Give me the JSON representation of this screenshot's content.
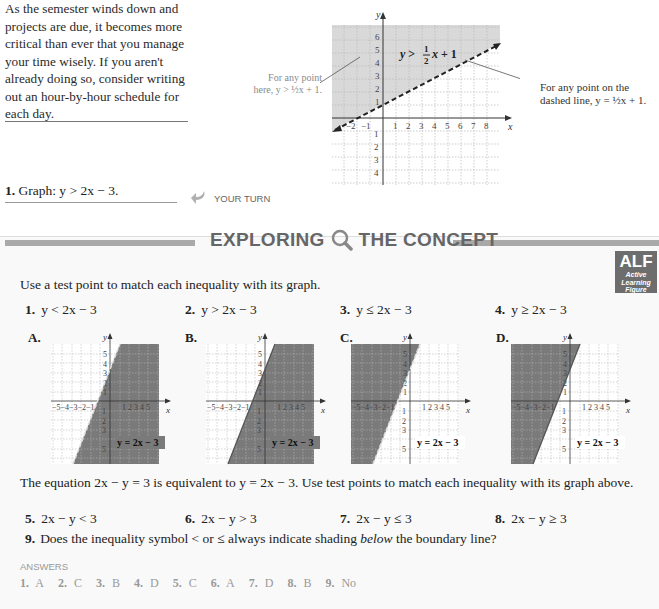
{
  "study_tip": {
    "text": "As the semester winds down and projects are due, it becomes more critical than ever that you manage your time wisely. If you aren't already doing so, consider writing out an hour-by-hour schedule for each day."
  },
  "example": {
    "number": "1.",
    "text": "Graph: y > 2x − 3.",
    "your_turn_label": "YOUR TURN",
    "your_turn_icon": "curved-arrow-icon"
  },
  "main_graph": {
    "inequality_label": "y > ½x + 1",
    "note_left_line1": "For any point",
    "note_left_line2": "here, y > ½x + 1.",
    "note_right_line1": "For any point on the",
    "note_right_line2": "dashed line, y = ½x + 1.",
    "x_axis_label": "x",
    "y_axis_label": "y"
  },
  "exploring": {
    "title_left": "EXPLORING",
    "title_right": "THE CONCEPT",
    "icon": "magnifier-icon",
    "alf": {
      "big": "ALF",
      "line1": "Active",
      "line2": "Learning",
      "line3": "Figure"
    },
    "instruction": "Use a test point to match each inequality with its graph.",
    "items": [
      {
        "num": "1.",
        "expr": "y < 2x − 3"
      },
      {
        "num": "2.",
        "expr": "y > 2x − 3"
      },
      {
        "num": "3.",
        "expr": "y ≤ 2x − 3"
      },
      {
        "num": "4.",
        "expr": "y ≥ 2x − 3"
      }
    ],
    "graphs": [
      {
        "label": "A.",
        "equation": "y = 2x − 3",
        "shade": "below",
        "line": "dashed"
      },
      {
        "label": "B.",
        "equation": "y = 2x − 3",
        "shade": "below",
        "line": "solid"
      },
      {
        "label": "C.",
        "equation": "y = 2x − 3",
        "shade": "above",
        "line": "dashed"
      },
      {
        "label": "D.",
        "equation": "y = 2x − 3",
        "shade": "above",
        "line": "solid"
      }
    ],
    "equiv_text": "The equation 2x − y = 3 is equivalent to y = 2x − 3. Use test points to match each inequality with its graph above.",
    "items2": [
      {
        "num": "5.",
        "expr": "2x − y < 3"
      },
      {
        "num": "6.",
        "expr": "2x − y > 3"
      },
      {
        "num": "7.",
        "expr": "2x − y ≤ 3"
      },
      {
        "num": "8.",
        "expr": "2x − y ≥ 3"
      }
    ],
    "q9_num": "9.",
    "q9_pre": "Does the inequality symbol < or ≤ always indicate shading ",
    "q9_em": "below",
    "q9_post": " the boundary line?",
    "answers_heading": "ANSWERS",
    "answers": [
      {
        "num": "1.",
        "val": "A"
      },
      {
        "num": "2.",
        "val": "C"
      },
      {
        "num": "3.",
        "val": "B"
      },
      {
        "num": "4.",
        "val": "D"
      },
      {
        "num": "5.",
        "val": "C"
      },
      {
        "num": "6.",
        "val": "A"
      },
      {
        "num": "7.",
        "val": "D"
      },
      {
        "num": "8.",
        "val": "B"
      },
      {
        "num": "9.",
        "val": "No"
      }
    ]
  },
  "colors": {
    "shade_light": "#d9d9d9",
    "shade_dark": "#7a7a7a",
    "rule_gray": "#a9a9a9",
    "muted_text": "#999999"
  }
}
